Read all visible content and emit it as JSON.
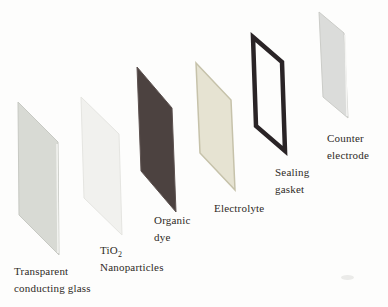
{
  "canvas": {
    "background": "#fdfdfc",
    "text_color": "#2e2a26"
  },
  "layers": [
    {
      "id": "transparent-conducting-glass",
      "line1": "Transparent",
      "line2": "conducting glass",
      "fill": "#d8dad4",
      "edge": "#c7c9c3",
      "highlight": "#f3f4f1"
    },
    {
      "id": "tio2-nanoparticles",
      "formula": "TiO",
      "formula_sub": "2",
      "line2": "Nanoparticles",
      "fill": "#f1f1ee",
      "edge": "#e5e5e1"
    },
    {
      "id": "organic-dye",
      "line1": "Organic",
      "line2": "dye",
      "fill": "#4c4240",
      "edge": "#5d5250"
    },
    {
      "id": "electrolyte",
      "line1": "Electrolyte",
      "fill": "#e6e3d2",
      "edge": "#c6c2aa"
    },
    {
      "id": "sealing-gasket",
      "line1": "Sealing",
      "line2": "gasket",
      "frame": "#2a2426"
    },
    {
      "id": "counter-electrode",
      "line1": "Counter",
      "line2": "electrode",
      "fill": "#dbdcda",
      "edge": "#cbccc8",
      "highlight": "#f4f4f2"
    }
  ]
}
